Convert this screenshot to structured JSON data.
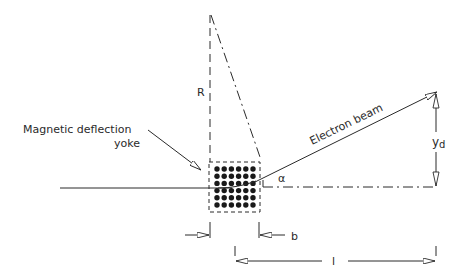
{
  "diagram": {
    "labels": {
      "yoke_line1": "Magnetic deflection",
      "yoke_line2": "yoke",
      "radius": "R",
      "beam": "Electron beam",
      "deflection_main": "y",
      "deflection_sub": "d",
      "angle": "α",
      "yoke_length": "b",
      "distance_to_screen": "l"
    },
    "yoke_grid": {
      "rows": 6,
      "cols": 6
    },
    "colors": {
      "stroke": "#2a2a2a",
      "background": "#ffffff"
    }
  }
}
